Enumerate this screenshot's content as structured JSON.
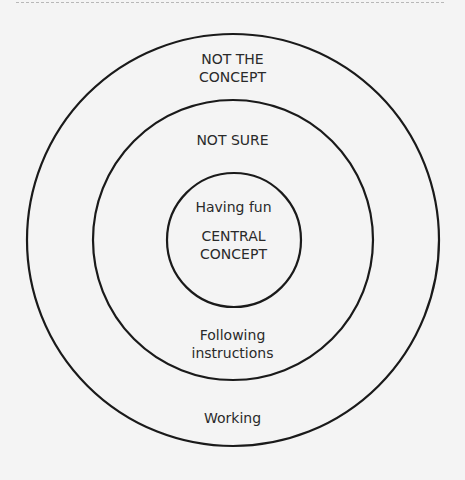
{
  "diagram": {
    "type": "concentric-circles",
    "circles": [
      {
        "name": "outer",
        "label": "NOT THE CONCEPT",
        "line1": "NOT THE",
        "line2": "CONCEPT",
        "example": "Working"
      },
      {
        "name": "middle",
        "label": "NOT SURE",
        "example_line1": "Following",
        "example_line2": "instructions"
      },
      {
        "name": "inner",
        "label": "CENTRAL CONCEPT",
        "line1": "CENTRAL",
        "line2": "CONCEPT",
        "example": "Having fun"
      }
    ],
    "stroke_color": "#1a1a1a",
    "background": "#f4f4f4"
  }
}
